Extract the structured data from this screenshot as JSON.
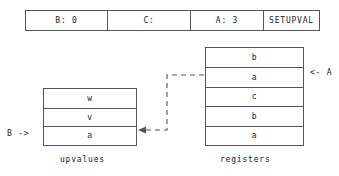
{
  "instruction": {
    "cells": [
      {
        "id": "b",
        "label": "B: 0"
      },
      {
        "id": "c",
        "label": "C:"
      },
      {
        "id": "a",
        "label": "A: 3"
      },
      {
        "id": "op",
        "label": "SETUPVAL"
      }
    ]
  },
  "upvalues": {
    "caption": "upvalues",
    "rows": [
      "w",
      "v",
      "a"
    ],
    "pointer": "B ->"
  },
  "registers": {
    "caption": "registers",
    "rows": [
      "b",
      "a",
      "c",
      "b",
      "a"
    ],
    "pointer": "<- A"
  },
  "colors": {
    "border": "#555555",
    "text": "#222222",
    "background": "#ffffff",
    "dashed": "#555555"
  }
}
